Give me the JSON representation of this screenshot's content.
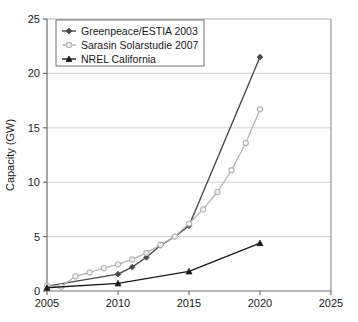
{
  "chart_data": {
    "type": "line",
    "title": "",
    "xlabel": "",
    "ylabel": "Capacity (GW)",
    "xlim": [
      2005,
      2025
    ],
    "ylim": [
      0,
      25
    ],
    "xticks": [
      "2005",
      "2010",
      "2015",
      "2020",
      "2025"
    ],
    "yticks": [
      "0",
      "5",
      "10",
      "15",
      "20",
      "25"
    ],
    "grid": "horizontal",
    "legend_position": "top-left",
    "series": [
      {
        "name": "Greenpeace/ESTIA 2003",
        "color": "#4a4a4a",
        "marker": "diamond",
        "x": [
          2005,
          2010,
          2011,
          2012,
          2013,
          2014,
          2015,
          2020
        ],
        "values": [
          0.45,
          1.55,
          2.2,
          3.1,
          4.2,
          5.0,
          6.0,
          21.5
        ]
      },
      {
        "name": "Sarasin Solarstudie 2007",
        "color": "#b4b4b4",
        "marker": "circle-open",
        "x": [
          2005,
          2006,
          2007,
          2008,
          2009,
          2010,
          2011,
          2012,
          2013,
          2014,
          2015,
          2016,
          2017,
          2018,
          2019,
          2020
        ],
        "values": [
          0.5,
          0.4,
          1.35,
          1.7,
          2.1,
          2.45,
          2.9,
          3.5,
          4.25,
          5.0,
          6.2,
          7.5,
          9.1,
          11.1,
          13.6,
          16.7
        ]
      },
      {
        "name": "NREL California",
        "color": "#1a1a1a",
        "marker": "triangle",
        "x": [
          2005,
          2010,
          2015,
          2020
        ],
        "values": [
          0.3,
          0.7,
          1.8,
          4.4
        ]
      }
    ]
  },
  "axes": {
    "y_title": "Capacity (GW)"
  }
}
